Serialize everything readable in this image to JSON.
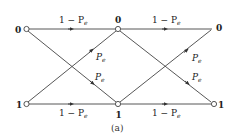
{
  "diagram": {
    "type": "channel-transition-diagram",
    "caption": "(a)",
    "nodes": {
      "left_top": {
        "label": "0"
      },
      "left_bottom": {
        "label": "1"
      },
      "mid_top": {
        "label": "0"
      },
      "mid_bottom": {
        "label": "1"
      },
      "right_top": {
        "label": "0"
      },
      "right_bottom": {
        "label": "1"
      }
    },
    "edges": {
      "left_top_to_mid_top": {
        "main": "1 − P",
        "sub": "e"
      },
      "left_bottom_to_mid_bottom": {
        "main": "1 − P",
        "sub": "e"
      },
      "left_bottom_to_mid_top": {
        "main": "P",
        "sub": "e"
      },
      "left_top_to_mid_bottom": {
        "main": "P",
        "sub": "e"
      },
      "mid_top_to_right_top": {
        "main": "1 − P",
        "sub": "e"
      },
      "mid_bottom_to_right_bottom": {
        "main": "1 − P",
        "sub": "e"
      },
      "mid_bottom_to_right_top": {
        "main": "P",
        "sub": "e"
      },
      "mid_top_to_right_bottom": {
        "main": "P",
        "sub": "e"
      }
    },
    "colors": {
      "line": "#444444",
      "text": "#222222",
      "background": "#ffffff"
    }
  }
}
